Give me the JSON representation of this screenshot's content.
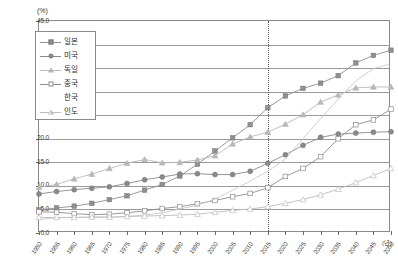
{
  "axis": {
    "y_unit": "(%)",
    "x_unit": "(년)",
    "y_ticks": [
      "45.0",
      "40.0",
      "35.0",
      "30.0",
      "25.0",
      "20.0",
      "15.0",
      "10.0",
      "5.0",
      "0.0"
    ],
    "x_ticks": [
      "1950",
      "1955",
      "1960",
      "1965",
      "1970",
      "1975",
      "1980",
      "1985",
      "1990",
      "1995",
      "2000",
      "2005",
      "2010",
      "2015",
      "2020",
      "2025",
      "2030",
      "2035",
      "2040",
      "2045",
      "2050"
    ]
  },
  "legend": {
    "items": [
      {
        "label": "일본",
        "marker": "square-filled",
        "color": "#8f8f8f"
      },
      {
        "label": "미국",
        "marker": "circle-filled",
        "color": "#8a8a8a"
      },
      {
        "label": "독일",
        "marker": "triangle-filled",
        "color": "#b9b9b9"
      },
      {
        "label": "중국",
        "marker": "square-open",
        "color": "#8d8d8d"
      },
      {
        "label": "한국",
        "marker": "none",
        "color": "#c9c9c9"
      },
      {
        "label": "인도",
        "marker": "triangle-open",
        "color": "#bdbdbd"
      }
    ]
  },
  "annotations": {
    "reference_line_year": "2015"
  },
  "chart_data": {
    "type": "line",
    "title": "",
    "subtitle": "",
    "xlabel": "(년)",
    "ylabel": "(%)",
    "xlim": [
      1950,
      2050
    ],
    "ylim": [
      0.0,
      45.0
    ],
    "ytick_step": 5.0,
    "xtick_step": 5,
    "grid": true,
    "legend_position": "top-left",
    "x": [
      1950,
      1955,
      1960,
      1965,
      1970,
      1975,
      1980,
      1985,
      1990,
      1995,
      2000,
      2005,
      2010,
      2015,
      2020,
      2025,
      2030,
      2035,
      2040,
      2045,
      2050
    ],
    "series": [
      {
        "name": "일본",
        "marker": "square-filled",
        "color": "#8f8f8f",
        "values": [
          4.9,
          5.3,
          5.7,
          6.3,
          7.1,
          7.9,
          9.1,
          10.3,
          12.1,
          14.6,
          17.4,
          20.2,
          23.0,
          26.6,
          29.1,
          30.7,
          31.8,
          33.4,
          36.1,
          37.7,
          38.8
        ]
      },
      {
        "name": "미국",
        "marker": "circle-filled",
        "color": "#8a8a8a",
        "values": [
          8.3,
          8.8,
          9.2,
          9.5,
          9.8,
          10.5,
          11.3,
          11.9,
          12.5,
          12.6,
          12.4,
          12.4,
          13.1,
          14.8,
          16.6,
          18.6,
          20.3,
          21.0,
          21.2,
          21.4,
          21.5
        ]
      },
      {
        "name": "독일",
        "marker": "triangle-filled",
        "color": "#b9b9b9",
        "values": [
          9.7,
          10.3,
          11.5,
          12.5,
          13.7,
          14.8,
          15.6,
          14.9,
          15.0,
          15.5,
          16.4,
          18.9,
          20.4,
          21.4,
          23.1,
          25.1,
          27.8,
          29.3,
          30.8,
          31.0,
          31.0
        ]
      },
      {
        "name": "중국",
        "marker": "square-open",
        "color": "#8d8d8d",
        "values": [
          4.5,
          4.4,
          4.1,
          3.9,
          4.0,
          4.3,
          4.7,
          5.2,
          5.6,
          6.2,
          6.9,
          7.7,
          8.4,
          9.6,
          12.0,
          13.7,
          16.2,
          20.0,
          23.0,
          24.0,
          26.3
        ]
      },
      {
        "name": "한국",
        "marker": "none",
        "color": "#c9c9c9",
        "values": [
          2.9,
          3.2,
          3.3,
          3.3,
          3.3,
          3.5,
          3.8,
          4.3,
          5.1,
          5.9,
          7.2,
          9.1,
          11.0,
          13.1,
          15.7,
          20.0,
          24.3,
          28.4,
          32.3,
          34.9,
          35.9
        ]
      },
      {
        "name": "인도",
        "marker": "triangle-open",
        "color": "#bdbdbd",
        "values": [
          3.3,
          3.3,
          3.3,
          3.4,
          3.4,
          3.5,
          3.6,
          3.7,
          3.8,
          4.0,
          4.4,
          4.8,
          5.1,
          5.6,
          6.3,
          7.1,
          8.1,
          9.3,
          10.7,
          12.2,
          13.7
        ]
      }
    ]
  }
}
